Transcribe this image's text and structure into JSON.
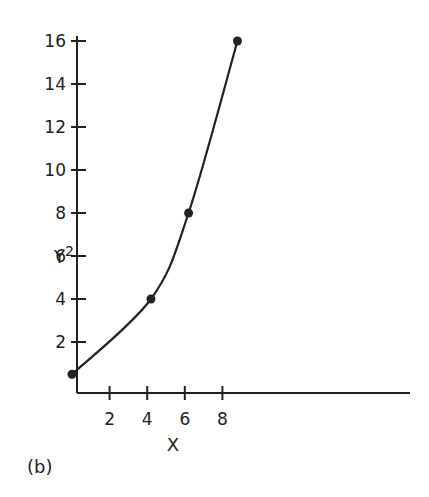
{
  "chart_data": {
    "type": "line",
    "title": "",
    "panel_label": "(b)",
    "xlabel": "X",
    "ylabel": "Y",
    "ylabel_superscript": "2",
    "xlim": [
      0,
      18
    ],
    "ylim": [
      0,
      16
    ],
    "x_ticks": [
      2,
      4,
      6,
      8
    ],
    "x_tick_labels": [
      "2",
      "4",
      "6",
      "8"
    ],
    "y_ticks": [
      2,
      4,
      6,
      8,
      10,
      12,
      14,
      16
    ],
    "y_tick_labels": [
      "2",
      "4",
      "6",
      "8",
      "10",
      "12",
      "14",
      "16"
    ],
    "grid": false,
    "legend": null,
    "series": [
      {
        "name": "Y^2 vs X",
        "marker": "filled-circle",
        "x": [
          0,
          4.2,
          6.2,
          8.8
        ],
        "y": [
          0.5,
          4,
          8,
          16
        ]
      }
    ],
    "colors": {
      "ink": "#222222",
      "background": "#ffffff"
    }
  }
}
